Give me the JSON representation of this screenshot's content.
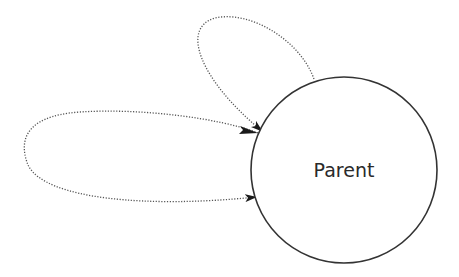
{
  "diagram": {
    "type": "state-diagram",
    "nodes": [
      {
        "id": "parent",
        "label": "Parent",
        "shape": "circle",
        "cx": 344,
        "cy": 170,
        "r": 93
      }
    ],
    "edges": [
      {
        "id": "self-loop-upper",
        "from": "parent",
        "to": "parent",
        "style": "dotted",
        "arrow": "end"
      },
      {
        "id": "self-loop-left",
        "from": "parent",
        "to": "parent",
        "style": "dotted",
        "arrow": "end"
      }
    ],
    "colors": {
      "stroke": "#333333",
      "dotted": "#555555",
      "text": "#2a2a2a",
      "background": "#ffffff"
    }
  }
}
